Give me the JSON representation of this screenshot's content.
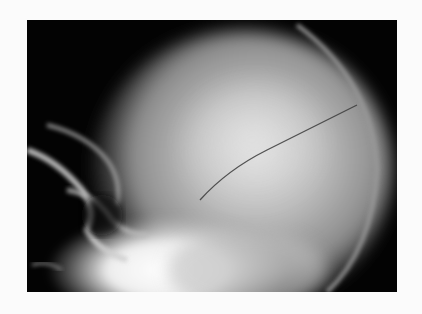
{
  "image": {
    "subject": "lateral skull radiograph",
    "description": "X-ray of skull (lateral view) showing a thin linear fracture line across the parietal bone",
    "colors": {
      "background": "#fbfbfb",
      "film": "#030303",
      "bone": "#f2f2f2"
    }
  }
}
